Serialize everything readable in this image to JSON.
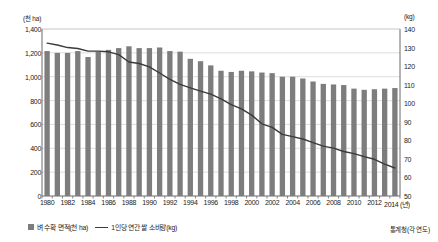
{
  "chart_data": {
    "type": "bar",
    "title": "",
    "xlabel": "연도",
    "x_axis_suffix": "(년)",
    "categories": [
      1980,
      1981,
      1982,
      1983,
      1984,
      1985,
      1986,
      1987,
      1988,
      1989,
      1990,
      1991,
      1992,
      1993,
      1994,
      1995,
      1996,
      1997,
      1998,
      1999,
      2000,
      2001,
      2002,
      2003,
      2004,
      2005,
      2006,
      2007,
      2008,
      2009,
      2010,
      2011,
      2012,
      2013,
      2014
    ],
    "xticklabels": [
      "1980",
      "1982",
      "1984",
      "1986",
      "1988",
      "1990",
      "1992",
      "1994",
      "1996",
      "1998",
      "2000",
      "2002",
      "2004",
      "2006",
      "2008",
      "2010",
      "2012",
      "2014"
    ],
    "grid": true,
    "legend_position": "bottom-left",
    "series": [
      {
        "name": "벼 수확 면적(천 ha)",
        "type": "bar",
        "axis": "left",
        "unit": "천 ha",
        "color": "#7d7d7d",
        "ylabel": "(천 ha)",
        "ylim": [
          0,
          1400
        ],
        "yticks": [
          0,
          200,
          400,
          600,
          800,
          1000,
          1200,
          1400
        ],
        "yticklabels": [
          "0",
          "200",
          "400",
          "600",
          "800",
          "1,000",
          "1,200",
          "1,400"
        ],
        "values": [
          1218,
          1206,
          1205,
          1214,
          1170,
          1209,
          1226,
          1228,
          1222,
          1225,
          1219,
          1206,
          1187,
          1198,
          1144,
          1057,
          1051,
          1053,
          1060,
          1067,
          1076,
          1083,
          1053,
          1016,
          1006,
          980,
          955,
          951,
          936,
          925,
          892,
          854,
          849,
          833,
          816
        ],
        "values_plot": [
          1215,
          1200,
          1200,
          1215,
          1165,
          1210,
          1225,
          1240,
          1255,
          1240,
          1240,
          1245,
          1215,
          1210,
          1150,
          1130,
          1095,
          1050,
          1040,
          1050,
          1045,
          1035,
          1030,
          1000,
          1000,
          985,
          960,
          940,
          935,
          930,
          900,
          890,
          895,
          900,
          905
        ]
      },
      {
        "name": "1인당 연간 쌀 소비량(kg)",
        "type": "line",
        "axis": "right",
        "unit": "kg",
        "color": "#3a3a3a",
        "ylabel": "(kg)",
        "ylim": [
          50,
          140
        ],
        "yticks": [
          50,
          60,
          70,
          80,
          90,
          100,
          110,
          120,
          130,
          140
        ],
        "yticklabels": [
          "50",
          "60",
          "70",
          "80",
          "90",
          "100",
          "110",
          "120",
          "130",
          "140"
        ],
        "values": [
          132.4,
          131.4,
          130.0,
          129.5,
          128.1,
          128.1,
          127.7,
          126.2,
          122.2,
          121.4,
          119.6,
          116.3,
          112.9,
          110.2,
          108.3,
          106.5,
          104.9,
          102.4,
          99.2,
          96.9,
          93.6,
          88.9,
          87.0,
          83.2,
          82.0,
          80.7,
          78.8,
          76.9,
          75.8,
          74.0,
          72.8,
          71.2,
          69.8,
          67.2,
          65.1
        ]
      }
    ]
  },
  "axes": {
    "left_unit": "(천 ha)",
    "right_unit": "(kg)",
    "x_last_label": "2014 (년)"
  },
  "legend": {
    "bar_label": "벼 수확 면적(천 ha)",
    "line_label": "1인당 연간 쌀 소비량(kg)"
  },
  "source": {
    "text": "통계청(각 연도)"
  },
  "colors": {
    "bar": "#7d7d7d",
    "line": "#3a3a3a",
    "grid": "#cfcfcf",
    "axis": "#6b6b6b",
    "text": "#222222"
  }
}
